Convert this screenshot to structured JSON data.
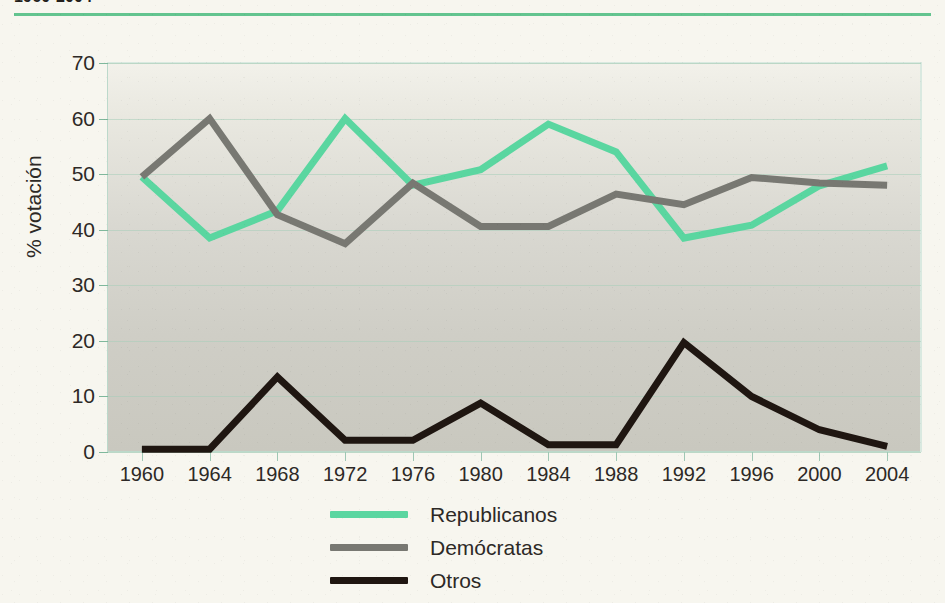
{
  "header": {
    "title": "1960-2004",
    "rule_color": "#63c48f"
  },
  "chart_data": {
    "type": "line",
    "title": "1960-2004",
    "xlabel": "",
    "ylabel": "% votación",
    "ylim": [
      0,
      70
    ],
    "yticks": [
      0,
      10,
      20,
      30,
      40,
      50,
      60,
      70
    ],
    "ytick_labels": [
      "0",
      "10",
      "20",
      "30",
      "40",
      "50",
      "60",
      "70"
    ],
    "grid": true,
    "legend_position": "bottom-center",
    "categories": [
      "1960",
      "1964",
      "1968",
      "1972",
      "1976",
      "1980",
      "1984",
      "1988",
      "1992",
      "1996",
      "2000",
      "2004"
    ],
    "x": [
      1960,
      1964,
      1968,
      1972,
      1976,
      1980,
      1984,
      1988,
      1992,
      1996,
      2000,
      2004
    ],
    "series": [
      {
        "name": "Republicanos",
        "color": "#5ad6a0",
        "values": [
          49.5,
          38.5,
          43.4,
          60.0,
          48.0,
          50.8,
          59.0,
          54.0,
          38.5,
          40.8,
          47.9,
          51.5
        ]
      },
      {
        "name": "Demócratas",
        "color": "#787872",
        "values": [
          49.5,
          60.0,
          42.7,
          37.5,
          48.4,
          40.6,
          40.6,
          46.4,
          44.5,
          49.4,
          48.4,
          48.0
        ]
      },
      {
        "name": "Otros",
        "color": "#1f1611",
        "values": [
          0.5,
          0.5,
          13.5,
          2.1,
          2.1,
          8.8,
          1.3,
          1.3,
          19.7,
          10.0,
          4.0,
          1.0
        ]
      }
    ]
  },
  "legend": {
    "items": [
      {
        "label": "Republicanos",
        "color": "#5ad6a0"
      },
      {
        "label": "Demócratas",
        "color": "#787872"
      },
      {
        "label": "Otros",
        "color": "#1f1611"
      }
    ]
  }
}
